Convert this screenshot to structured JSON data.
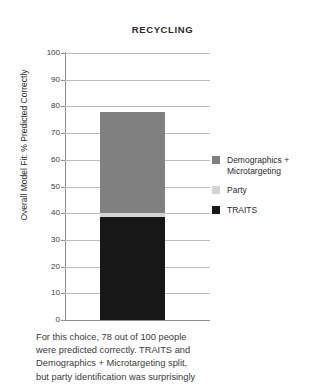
{
  "chart_data": {
    "type": "bar",
    "title": "RECYCLING",
    "xlabel": "",
    "ylabel": "Overall Model Fit: % Predicted Correctly",
    "ylim": [
      0,
      100
    ],
    "grid": true,
    "legend_position": "right",
    "stacked": true,
    "categories": [
      "Recycling"
    ],
    "yticks": [
      "100",
      "90",
      "80",
      "70",
      "60",
      "50",
      "40",
      "30",
      "20",
      "10",
      "0"
    ],
    "ytick_values": [
      100,
      90,
      80,
      70,
      60,
      50,
      40,
      30,
      20,
      10,
      0
    ],
    "total": 78,
    "series": [
      {
        "name": "Demographics + Microtargeting",
        "values": [
          38
        ],
        "color": "#808080"
      },
      {
        "name": "Party",
        "values": [
          1.5
        ],
        "color": "#d4d4d4"
      },
      {
        "name": "TRAITS",
        "values": [
          38.5
        ],
        "color": "#171717"
      }
    ]
  },
  "legend": {
    "items": [
      {
        "label": "Demographics + Microtargeting",
        "color": "#808080"
      },
      {
        "label": "Party",
        "color": "#d4d4d4"
      },
      {
        "label": "TRAITS",
        "color": "#171717"
      }
    ]
  },
  "caption": {
    "lines": [
      "For this choice, 78 out of 100 people",
      "were predicted correctly. TRAITS and",
      "Demographics + Microtargeting split,",
      "but party identification was surprisingly"
    ]
  }
}
